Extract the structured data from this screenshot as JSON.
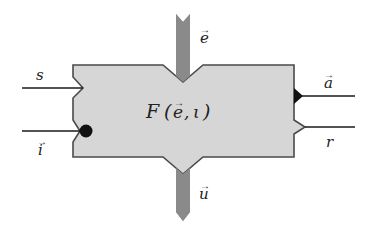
{
  "diagram": {
    "block_label": "F (e⃗, ι)",
    "block_label_parts": {
      "func": "F",
      "open": "(",
      "arg1": "e",
      "sep": ",",
      "arg2": "ι",
      "close": ")"
    },
    "inputs": {
      "top_bar": {
        "label": "e",
        "vector": true
      },
      "left_upper": {
        "label": "s",
        "vector": false
      },
      "left_lower": {
        "label": "i",
        "vector": true
      }
    },
    "outputs": {
      "bottom_bar": {
        "label": "u",
        "vector": true
      },
      "right_upper": {
        "label": "a",
        "vector": true
      },
      "right_lower": {
        "label": "r",
        "vector": false
      }
    },
    "colors": {
      "block_fill": "#d6d6d6",
      "block_stroke": "#4a4a4a",
      "bar_fill": "#8a8a8a",
      "wire": "#1a1a1a",
      "port_solid": "#111111",
      "text": "#222222"
    }
  }
}
